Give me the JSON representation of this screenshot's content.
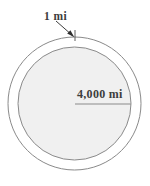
{
  "figure": {
    "background_color": "#ffffff",
    "stroke_color": "#8a8a8a",
    "text_color": "#3d3d3d",
    "inner_fill_color": "#f0f0f0",
    "annotations": {
      "gap_label": "1 mi",
      "radius_label": "4,000 mi"
    },
    "outer_circle": {
      "name": "outer-circle",
      "center_x": 74.5,
      "center_y": 103.5,
      "radius": 66.5
    },
    "inner_circle": {
      "name": "inner-circle",
      "center_x": 74.5,
      "center_y": 103.5,
      "radius": 56.5
    },
    "radius_line": {
      "name": "radius-line",
      "x1": 75,
      "y1": 104,
      "x2": 131,
      "y2": 104
    },
    "leader_line": {
      "name": "leader-line",
      "x1": 57,
      "y1": 22,
      "x2": 73,
      "y2": 36
    },
    "gap_tick": {
      "name": "gap-tick-line",
      "x1": 75,
      "y1": 30,
      "x2": 75,
      "y2": 41
    }
  }
}
